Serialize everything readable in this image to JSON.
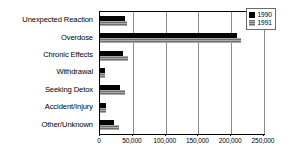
{
  "chart_data": {
    "type": "bar",
    "orientation": "horizontal",
    "title": "",
    "subtitle": "",
    "xlabel": "",
    "ylabel": "",
    "grid": true,
    "legend_position": "top-right",
    "xlim": [
      0,
      250000
    ],
    "xticks": [
      0,
      50000,
      100000,
      150000,
      200000,
      250000
    ],
    "xtick_labels": [
      "0",
      "50,000",
      "100,000",
      "150,000",
      "200,000",
      "250,000"
    ],
    "categories": [
      "Unexpected Reaction",
      "Overdose",
      "Chronic Effects",
      "Withdrawal",
      "Seeking Detox",
      "Accident/Injury",
      "Other/Unknown"
    ],
    "series": [
      {
        "name": "1990",
        "color": "#050505",
        "values": [
          38000,
          209000,
          35000,
          7000,
          30000,
          9000,
          21000
        ]
      },
      {
        "name": "1991",
        "color": "#6e6e6e",
        "values": [
          41000,
          215000,
          42000,
          7000,
          38000,
          9000,
          29000
        ]
      }
    ]
  },
  "legend": {
    "entries": [
      {
        "label": "1990"
      },
      {
        "label": "1991"
      }
    ]
  }
}
